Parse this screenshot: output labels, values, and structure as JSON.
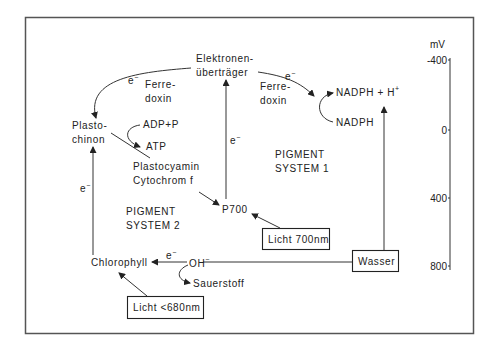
{
  "diagram": {
    "unit_label": "mV",
    "scale_ticks": [
      "-400",
      "0",
      "400",
      "800"
    ],
    "nodes": {
      "elektronen_line1": "Elektronen-",
      "elektronen_line2": "überträger",
      "ferredoxin_left_1": "Ferre-",
      "ferredoxin_left_2": "doxin",
      "ferredoxin_right_1": "Ferre-",
      "ferredoxin_right_2": "doxin",
      "nadph_h": "NADPH + H",
      "nadph_h_sup": "+",
      "nadph": "NADPH",
      "plastochinon_1": "Plasto-",
      "plastochinon_2": "chinon",
      "adp_p": "ADP+P",
      "atp": "ATP",
      "plastocyamin": "Plastocyamin",
      "cytochrom": "Cytochrom f",
      "pigment_system_1_a": "PIGMENT",
      "pigment_system_1_b": "SYSTEM 1",
      "pigment_system_2_a": "PIGMENT",
      "pigment_system_2_b": "SYSTEM 2",
      "p700": "P700",
      "licht_700": "Licht 700nm",
      "wasser": "Wasser",
      "chlorophyll": "Chlorophyll",
      "oh": "OH",
      "oh_sup": "−",
      "sauerstoff": "Sauerstoff",
      "licht_680": "Licht <680nm"
    },
    "electron_label": "e",
    "electron_sup": "−"
  }
}
